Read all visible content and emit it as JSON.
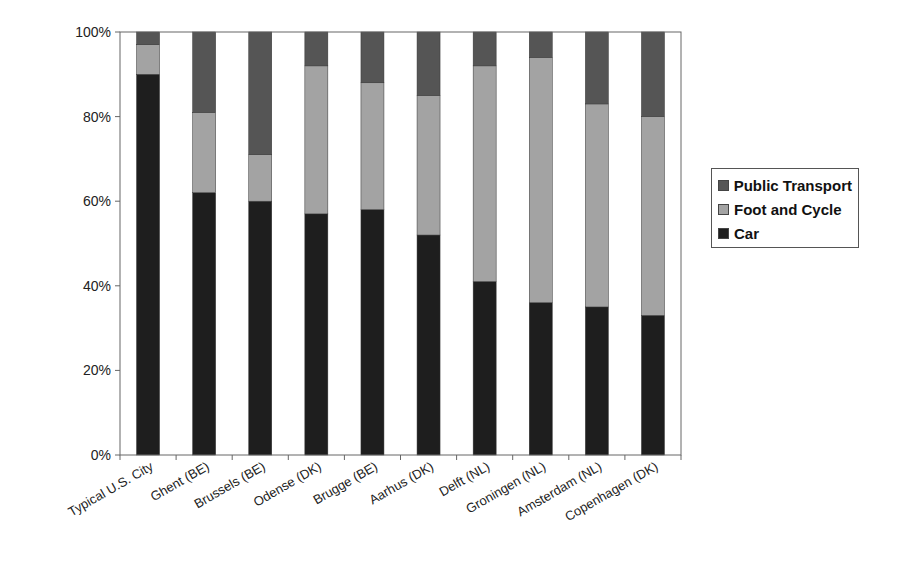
{
  "chart_data": {
    "type": "bar",
    "stacked": true,
    "normalized_percent": true,
    "title": "",
    "xlabel": "",
    "ylabel": "",
    "ylim": [
      0,
      100
    ],
    "yticks": [
      "0%",
      "20%",
      "40%",
      "60%",
      "80%",
      "100%"
    ],
    "grid": false,
    "legend_position": "right",
    "categories": [
      "Typical U.S. City",
      "Ghent (BE)",
      "Brussels (BE)",
      "Odense (DK)",
      "Brugge (BE)",
      "Aarhus (DK)",
      "Delft (NL)",
      "Groningen (NL)",
      "Amsterdam (NL)",
      "Copenhagen (DK)"
    ],
    "series": [
      {
        "name": "Car",
        "color": "#1e1e1e",
        "values": [
          90,
          62,
          60,
          57,
          58,
          52,
          41,
          36,
          35,
          33
        ]
      },
      {
        "name": "Foot and Cycle",
        "color": "#a3a3a3",
        "values": [
          7,
          19,
          11,
          35,
          30,
          33,
          51,
          58,
          48,
          47
        ]
      },
      {
        "name": "Public Transport",
        "color": "#555555",
        "values": [
          3,
          19,
          29,
          8,
          12,
          15,
          8,
          6,
          17,
          20
        ]
      }
    ]
  },
  "legend": {
    "items": [
      {
        "label": "Public Transport",
        "color": "#555555"
      },
      {
        "label": "Foot and Cycle",
        "color": "#a3a3a3"
      },
      {
        "label": "Car",
        "color": "#1e1e1e"
      }
    ]
  }
}
